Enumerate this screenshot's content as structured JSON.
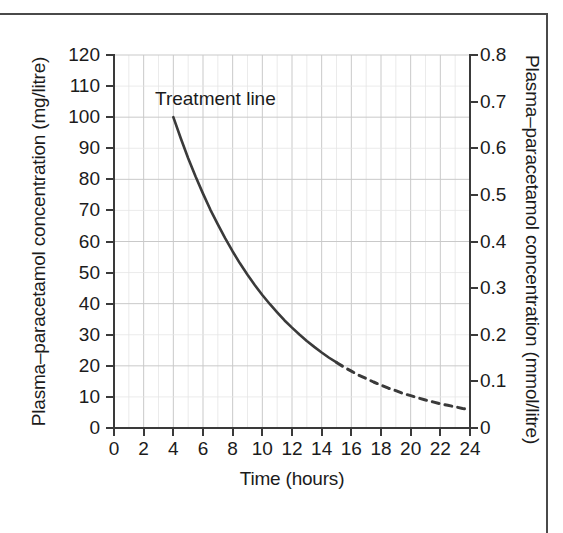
{
  "chart_data": {
    "type": "line",
    "title": "",
    "xlabel": "Time (hours)",
    "ylabel": "Plasma–paracetamol concentration (mg/litre)",
    "y2label": "Plasma–paracetamol concentration (mmol/litre)",
    "xlim": [
      0,
      24
    ],
    "ylim": [
      0,
      120
    ],
    "y2lim": [
      0,
      0.8
    ],
    "grid": true,
    "legend": "none",
    "xticks": [
      0,
      2,
      4,
      6,
      8,
      10,
      12,
      14,
      16,
      18,
      20,
      22,
      24
    ],
    "xtick_labels": [
      "0",
      "2",
      "4",
      "6",
      "8",
      "10",
      "12",
      "14",
      "16",
      "18",
      "20",
      "22",
      "24"
    ],
    "yticks": [
      0,
      10,
      20,
      30,
      40,
      50,
      60,
      70,
      80,
      90,
      100,
      110,
      120
    ],
    "ytick_labels": [
      "0",
      "10",
      "20",
      "30",
      "40",
      "50",
      "60",
      "70",
      "80",
      "90",
      "100",
      "110",
      "120"
    ],
    "y2ticks": [
      0,
      0.1,
      0.2,
      0.3,
      0.4,
      0.5,
      0.6,
      0.7,
      0.8
    ],
    "y2tick_labels": [
      "0",
      "0.1",
      "0.2",
      "0.3",
      "0.4",
      "0.5",
      "0.6",
      "0.7",
      "0.8"
    ],
    "minor_grid_x_step": 1,
    "minor_grid_y_step": 10,
    "major_grid_x_step": 2,
    "major_grid_y_step": 20,
    "line_color": "#3a3a3a",
    "grid_color": "#dcdcdc",
    "axis_color": "#3a3a3a",
    "annotations": [
      {
        "text": "Treatment line",
        "x": 6.5,
        "y": 108
      }
    ],
    "series": [
      {
        "name": "Treatment line (solid segment)",
        "style": "solid",
        "x": [
          4,
          4.5,
          5,
          5.5,
          6,
          6.5,
          7,
          7.5,
          8,
          8.5,
          9,
          9.5,
          10,
          10.5,
          11,
          11.5,
          12,
          12.5,
          13,
          13.5,
          14,
          14.5,
          15
        ],
        "y": [
          100,
          93.2,
          86.8,
          80.9,
          75.4,
          70.2,
          65.5,
          61.0,
          56.8,
          52.9,
          49.3,
          45.9,
          42.8,
          39.9,
          37.2,
          34.6,
          32.3,
          30.1,
          28.0,
          26.1,
          24.3,
          22.6,
          21.1
        ]
      },
      {
        "name": "Treatment line (dashed extrapolation)",
        "style": "dashed",
        "x": [
          15,
          15.5,
          16,
          16.5,
          17,
          17.5,
          18,
          18.5,
          19,
          19.5,
          20,
          20.5,
          21,
          21.5,
          22,
          22.5,
          23,
          23.5,
          24
        ],
        "y": [
          21.1,
          19.6,
          18.3,
          17.0,
          15.9,
          14.8,
          13.8,
          12.8,
          12.0,
          11.1,
          10.4,
          9.7,
          9.0,
          8.4,
          7.8,
          7.3,
          6.8,
          6.3,
          5.9
        ]
      }
    ]
  }
}
